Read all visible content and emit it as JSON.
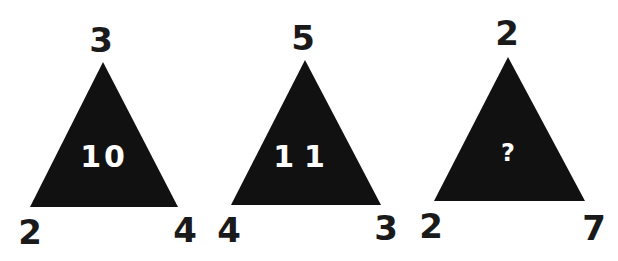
{
  "puzzle": {
    "triangle_fill": "#111111",
    "number_color": "#1a1a1a",
    "center_color": "#ffffff",
    "triangles": [
      {
        "top": "3",
        "bottom_left": "2",
        "bottom_right": "4",
        "center": "10"
      },
      {
        "top": "5",
        "bottom_left": "4",
        "bottom_right": "3",
        "center": "11"
      },
      {
        "top": "2",
        "bottom_left": "2",
        "bottom_right": "7",
        "center": "?"
      }
    ]
  }
}
